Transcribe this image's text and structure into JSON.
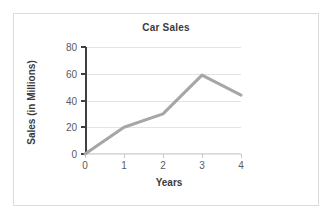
{
  "chart_data": {
    "type": "line",
    "title": "Car Sales",
    "xlabel": "Years",
    "ylabel": "Sales (in Millions)",
    "x": [
      0,
      1,
      2,
      3,
      4
    ],
    "values": [
      0,
      20,
      30,
      59,
      44
    ],
    "series": [
      {
        "name": "Car Sales",
        "values": [
          0,
          20,
          30,
          59,
          44
        ]
      }
    ],
    "xlim": [
      0,
      4
    ],
    "ylim": [
      0,
      80
    ],
    "xticks": [
      0,
      1,
      2,
      3,
      4
    ],
    "yticks": [
      0,
      20,
      40,
      60,
      80
    ],
    "xtick_labels": [
      "0",
      "1",
      "2",
      "3",
      "4"
    ],
    "ytick_labels": [
      "0",
      "20",
      "40",
      "60",
      "80"
    ],
    "grid": "horizontal",
    "legend": "none",
    "line_color": "#a6a6a6",
    "line_width": 3,
    "grid_color": "#e3e3e3",
    "axis_color": "#404040",
    "text_color": "#3b3b3b",
    "background": "#ffffff",
    "border_color": "#dcdcdc"
  }
}
